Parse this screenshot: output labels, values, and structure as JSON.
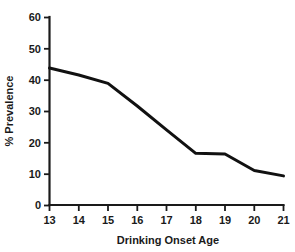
{
  "chart_data": {
    "type": "line",
    "title": "",
    "subtitle": "",
    "xlabel": "Drinking Onset Age",
    "ylabel": "% Prevalence",
    "x": [
      13,
      14,
      15,
      16,
      17,
      18,
      19,
      20,
      21
    ],
    "values": [
      43.7,
      41.5,
      38.8,
      31.6,
      24.0,
      16.5,
      16.3,
      11.0,
      9.3
    ],
    "series": [
      {
        "name": "% Prevalence",
        "values": [
          43.7,
          41.5,
          38.8,
          31.6,
          24.0,
          16.5,
          16.3,
          11.0,
          9.3
        ],
        "color": "#111111"
      }
    ],
    "xlim": [
      13,
      21
    ],
    "ylim": [
      0,
      60
    ],
    "xticks": [
      "13",
      "14",
      "15",
      "16",
      "17",
      "18",
      "19",
      "20",
      "21"
    ],
    "yticks": [
      "0",
      "10",
      "20",
      "30",
      "40",
      "50",
      "60"
    ],
    "xtick_values": [
      13,
      14,
      15,
      16,
      17,
      18,
      19,
      20,
      21
    ],
    "ytick_values": [
      0,
      10,
      20,
      30,
      40,
      50,
      60
    ],
    "grid": false,
    "legend": false,
    "legend_position": "none",
    "markers": false,
    "line_color": "#111111",
    "axis_color": "#1a1a1a",
    "background": "#ffffff"
  }
}
